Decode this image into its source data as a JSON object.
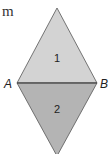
{
  "text_fragment": "m",
  "diagram": {
    "shape": "rhombus split by diagonal AB",
    "vertices": {
      "left": "A",
      "right": "B"
    },
    "regions": [
      {
        "label": "1",
        "position": "top triangle",
        "color": "#d3d3d3"
      },
      {
        "label": "2",
        "position": "bottom triangle",
        "color": "#b4b4b4"
      }
    ],
    "stroke_color": "#555555"
  }
}
